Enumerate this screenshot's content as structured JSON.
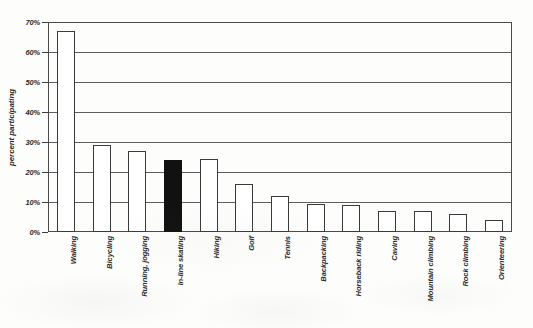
{
  "chart_data": {
    "type": "bar",
    "title": "",
    "subtitle": "",
    "xlabel": "",
    "ylabel": "percent participating",
    "ylim": [
      0,
      70
    ],
    "ytick_labels": [
      "70%",
      "60%",
      "50%",
      "40%",
      "30%",
      "20%",
      "10%",
      "0%"
    ],
    "ytick_values": [
      70,
      60,
      50,
      40,
      30,
      20,
      10,
      0
    ],
    "grid": true,
    "legend": "none",
    "highlight_category": "In-line skating",
    "highlight_color": "#111111",
    "bar_fill_color": "#ffffff",
    "bar_outline_color": "#3a3a3a",
    "categories": [
      "Walking",
      "Bicycling",
      "Running, jogging",
      "In-line skating",
      "Hiking",
      "Golf",
      "Tennis",
      "Backpacking",
      "Horseback riding",
      "Caving",
      "Mountain climbing",
      "Rock climbing",
      "Orienteering"
    ],
    "values": [
      67,
      29,
      27,
      24,
      24.5,
      16,
      12,
      9.5,
      9,
      7,
      7,
      6,
      4
    ],
    "highlighted": [
      false,
      false,
      false,
      true,
      false,
      false,
      false,
      false,
      false,
      false,
      false,
      false,
      false
    ]
  }
}
